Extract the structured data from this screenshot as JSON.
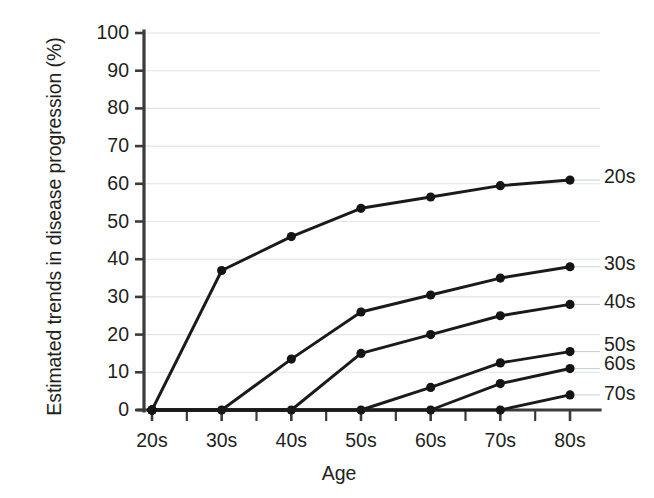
{
  "chart_data": {
    "type": "line",
    "title": "",
    "xlabel": "Age",
    "ylabel": "Estimated trends in disease progression (%)",
    "categories": [
      "20s",
      "30s",
      "40s",
      "50s",
      "60s",
      "70s",
      "80s"
    ],
    "xticklabels": [
      "20s",
      "30s",
      "40s",
      "50s",
      "60s",
      "70s",
      "80s"
    ],
    "yticklabels": [
      "0",
      "10",
      "20",
      "30",
      "40",
      "50",
      "60",
      "70",
      "80",
      "90",
      "100"
    ],
    "ylim": [
      0,
      100
    ],
    "ytick_step": 10,
    "grid": "horizontal",
    "legend_position": "right-of-line-ends",
    "marker": "filled-circle",
    "line_color": "#1a1a1a",
    "gridline_color": "#dde6e8",
    "axis_color": "#3b3b3b",
    "series": [
      {
        "name": "20s",
        "label": "20s",
        "values": [
          0,
          37,
          46,
          53.5,
          56.5,
          59.5,
          61
        ]
      },
      {
        "name": "30s",
        "label": "30s",
        "values": [
          0,
          0,
          13.5,
          26,
          30.5,
          35,
          38
        ]
      },
      {
        "name": "40s",
        "label": "40s",
        "values": [
          0,
          0,
          0,
          15,
          20,
          25,
          28
        ]
      },
      {
        "name": "50s",
        "label": "50s",
        "values": [
          0,
          0,
          0,
          0,
          6,
          12.5,
          15.5
        ]
      },
      {
        "name": "60s",
        "label": "60s",
        "values": [
          0,
          0,
          0,
          0,
          0,
          7,
          11
        ]
      },
      {
        "name": "70s",
        "label": "70s",
        "values": [
          0,
          0,
          0,
          0,
          0,
          0,
          4
        ]
      }
    ]
  },
  "axes": {
    "y_title": "Estimated trends in disease progression (%)",
    "x_title": "Age"
  }
}
